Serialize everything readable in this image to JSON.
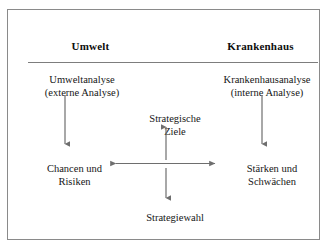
{
  "figure": {
    "headers": {
      "left": "Umwelt",
      "right": "Krankenhaus"
    },
    "nodes": {
      "analysis_left": {
        "line1": "Umweltanalyse",
        "line2": "(externe Analyse)"
      },
      "analysis_right": {
        "line1": "Krankenhausanalyse",
        "line2": "(interne Analyse)"
      },
      "goals_center": {
        "line1": "Strategische",
        "line2": "Ziele"
      },
      "swot_left": {
        "line1": "Chancen und",
        "line2": "Risiken"
      },
      "swot_right": {
        "line1": "Stärken und",
        "line2": "Schwächen"
      },
      "choice_center": {
        "line1": "Strategiewahl",
        "line2": ""
      }
    },
    "arrows": [
      {
        "name": "arrow-umweltanalyse-to-chancen",
        "direction": "down",
        "from": "Umweltanalyse (externe Analyse)",
        "to": "Chancen und Risiken"
      },
      {
        "name": "arrow-krankenhausanalyse-to-staerken",
        "direction": "down",
        "from": "Krankenhausanalyse (interne Analyse)",
        "to": "Stärken und Schwächen"
      },
      {
        "name": "arrow-chancen-staerken-bidirectional",
        "direction": "both",
        "from": "Chancen und Risiken",
        "to": "Stärken und Schwächen"
      },
      {
        "name": "arrow-to-strategische-ziele",
        "direction": "up",
        "from": "center axis",
        "to": "Strategische Ziele"
      },
      {
        "name": "arrow-to-strategiewahl",
        "direction": "down",
        "from": "center axis",
        "to": "Strategiewahl"
      }
    ],
    "colors": {
      "frame_border": "#8a8a8a",
      "rule": "#7d7d7d",
      "arrow": "#6e6e6e",
      "text": "#161616",
      "background": "#ffffff"
    }
  }
}
